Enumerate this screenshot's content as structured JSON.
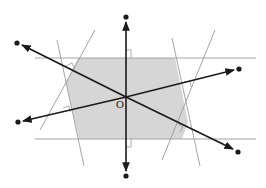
{
  "diagram": {
    "origin_label": "O",
    "colors": {
      "background": "#ffffff",
      "shaded_region": "#d6d6d6",
      "thin_lines": "#9a9a9a",
      "thick_lines": "#1a1a1a",
      "points": "#1a1a1a"
    },
    "origin": [
      126,
      97
    ],
    "arrow_lines": [
      {
        "name": "vertical",
        "from": [
          126,
          17
        ],
        "to": [
          126,
          176
        ]
      },
      {
        "name": "steep-diagonal",
        "from": [
          17,
          43
        ],
        "to": [
          238,
          152
        ]
      },
      {
        "name": "shallow-diagonal",
        "from": [
          18,
          122
        ],
        "to": [
          239,
          69
        ]
      }
    ],
    "shaded_polygon": [
      [
        78,
        58
      ],
      [
        175,
        58
      ],
      [
        188,
        122
      ],
      [
        182,
        139
      ],
      [
        79,
        139
      ],
      [
        66,
        82
      ]
    ],
    "thin_lines": [
      {
        "from": [
          35,
          58
        ],
        "to": [
          256,
          58
        ]
      },
      {
        "from": [
          35,
          139
        ],
        "to": [
          256,
          139
        ]
      },
      {
        "from": [
          57,
          40
        ],
        "to": [
          84,
          166
        ]
      },
      {
        "from": [
          95,
          30
        ],
        "to": [
          40,
          130
        ]
      },
      {
        "from": [
          172,
          38
        ],
        "to": [
          200,
          166
        ]
      },
      {
        "from": [
          215,
          30
        ],
        "to": [
          162,
          160
        ]
      }
    ]
  }
}
